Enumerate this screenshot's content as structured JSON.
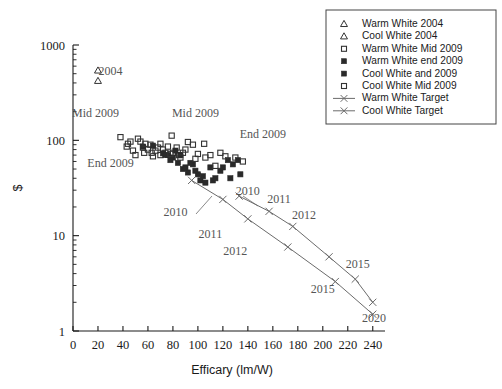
{
  "chart_data": {
    "type": "scatter",
    "title": "",
    "xlabel": "Efficary (lm/W)",
    "ylabel": "$",
    "xlim": [
      0,
      245
    ],
    "ylim": [
      1,
      1000
    ],
    "yscale": "log",
    "xticks": [
      0,
      20,
      40,
      60,
      80,
      100,
      120,
      140,
      160,
      180,
      200,
      220,
      240
    ],
    "xticklabels": [
      "0",
      "20",
      "40",
      "60",
      "80",
      "100",
      "120",
      "140",
      "160",
      "180",
      "200",
      "220",
      "240"
    ],
    "yticks": [
      1,
      10,
      100,
      1000
    ],
    "yticklabels": [
      "1",
      "10",
      "100",
      "1000"
    ],
    "grid": false,
    "legend_position": "top-right",
    "series": [
      {
        "name": "Warm White 2004",
        "marker": "open-triangle",
        "points": [
          [
            20,
            540
          ]
        ]
      },
      {
        "name": "Cool White 2004",
        "marker": "open-triangle",
        "points": [
          [
            20,
            420
          ]
        ]
      },
      {
        "name": "Warm White Mid 2009",
        "marker": "open-square",
        "points": [
          [
            38,
            108
          ],
          [
            43,
            86
          ],
          [
            46,
            97
          ],
          [
            48,
            78
          ],
          [
            52,
            104
          ],
          [
            54,
            97
          ],
          [
            56,
            84
          ],
          [
            57,
            74
          ],
          [
            60,
            80
          ],
          [
            62,
            90
          ],
          [
            63,
            74
          ],
          [
            66,
            78
          ],
          [
            68,
            84
          ],
          [
            70,
            70
          ],
          [
            72,
            80
          ],
          [
            74,
            74
          ],
          [
            76,
            86
          ],
          [
            79,
            112
          ],
          [
            80,
            74
          ],
          [
            83,
            84
          ],
          [
            85,
            70
          ],
          [
            88,
            74
          ],
          [
            92,
            96
          ],
          [
            96,
            90
          ],
          [
            100,
            72
          ],
          [
            105,
            92
          ],
          [
            110,
            70
          ],
          [
            118,
            74
          ],
          [
            130,
            66
          ]
        ]
      },
      {
        "name": "Warm White end 2009",
        "marker": "filled-square",
        "points": [
          [
            56,
            86
          ],
          [
            72,
            73
          ],
          [
            76,
            70
          ],
          [
            80,
            66
          ],
          [
            84,
            58
          ],
          [
            86,
            70
          ],
          [
            88,
            50
          ],
          [
            92,
            46
          ],
          [
            96,
            56
          ],
          [
            100,
            44
          ],
          [
            104,
            42
          ],
          [
            110,
            52
          ],
          [
            112,
            38
          ],
          [
            118,
            48
          ],
          [
            124,
            62
          ],
          [
            128,
            56
          ],
          [
            132,
            62
          ],
          [
            134,
            44
          ]
        ]
      },
      {
        "name": "Cool White and 2009",
        "marker": "filled-square",
        "points": [
          [
            64,
            88
          ],
          [
            74,
            70
          ],
          [
            78,
            62
          ],
          [
            82,
            78
          ],
          [
            90,
            52
          ],
          [
            94,
            58
          ],
          [
            98,
            48
          ],
          [
            102,
            38
          ],
          [
            106,
            36
          ],
          [
            114,
            40
          ],
          [
            120,
            52
          ],
          [
            126,
            40
          ]
        ]
      },
      {
        "name": "Cool White Mid 2009",
        "marker": "open-square",
        "points": [
          [
            44,
            92
          ],
          [
            50,
            70
          ],
          [
            58,
            92
          ],
          [
            64,
            68
          ],
          [
            70,
            92
          ],
          [
            78,
            72
          ],
          [
            86,
            66
          ],
          [
            90,
            80
          ],
          [
            98,
            64
          ],
          [
            106,
            66
          ],
          [
            114,
            54
          ],
          [
            122,
            68
          ],
          [
            136,
            60
          ]
        ]
      },
      {
        "name": "Warm White Target",
        "marker": "x-line",
        "points": [
          [
            95,
            38
          ],
          [
            120,
            24
          ],
          [
            140,
            15
          ],
          [
            172,
            7.6
          ],
          [
            210,
            3.3
          ],
          [
            240,
            1.5
          ]
        ],
        "point_labels": [
          "2010",
          "2011",
          "2012",
          "",
          "2015",
          "2020"
        ]
      },
      {
        "name": "Cool White Target",
        "marker": "x-line",
        "points": [
          [
            133,
            26
          ],
          [
            157,
            18
          ],
          [
            176,
            12.5
          ],
          [
            205,
            6.0
          ],
          [
            226,
            3.5
          ],
          [
            240,
            2.0
          ]
        ],
        "point_labels": [
          "2010",
          "2011",
          "2012",
          "",
          "2015",
          ""
        ]
      }
    ],
    "annotations": [
      {
        "text": "2004",
        "x": 30,
        "y": 490,
        "color": "#1a1a1a"
      },
      {
        "text": "Mid 2009",
        "x": 18,
        "y": 175,
        "color": "#555555"
      },
      {
        "text": "Mid 2009",
        "x": 98,
        "y": 175,
        "color": "#555555"
      },
      {
        "text": "End 2009",
        "x": 30,
        "y": 52,
        "color": "#555555"
      },
      {
        "text": "End 2009",
        "x": 152,
        "y": 105,
        "color": "#555555"
      },
      {
        "text": "2010",
        "x": 82,
        "y": 16,
        "color": "#555555"
      },
      {
        "text": "2010",
        "x": 140,
        "y": 27,
        "color": "#555555"
      },
      {
        "text": "2011",
        "x": 110,
        "y": 9.5,
        "color": "#555555"
      },
      {
        "text": "2011",
        "x": 165,
        "y": 22,
        "color": "#555555"
      },
      {
        "text": "2012",
        "x": 130,
        "y": 6.2,
        "color": "#555555"
      },
      {
        "text": "2012",
        "x": 185,
        "y": 15,
        "color": "#555555"
      },
      {
        "text": "2015",
        "x": 200,
        "y": 2.5,
        "color": "#555555"
      },
      {
        "text": "2015",
        "x": 228,
        "y": 4.6,
        "color": "#555555"
      },
      {
        "text": "2020",
        "x": 241,
        "y": 1.25,
        "color": "#1a1a1a"
      }
    ]
  },
  "legend": {
    "items": [
      {
        "label": "Warm White 2004",
        "marker": "open-triangle"
      },
      {
        "label": "Cool White 2004",
        "marker": "open-triangle"
      },
      {
        "label": "Warm White Mid 2009",
        "marker": "open-square"
      },
      {
        "label": "Warm White end 2009",
        "marker": "filled-square"
      },
      {
        "label": "Cool White and 2009",
        "marker": "filled-square"
      },
      {
        "label": "Cool White Mid 2009",
        "marker": "open-square"
      },
      {
        "label": "Warm White Target",
        "marker": "x-line"
      },
      {
        "label": "Cool White Target",
        "marker": "x-line"
      }
    ]
  },
  "colors": {
    "axis": "#1a1a1a",
    "marker_open": "#333333",
    "marker_filled": "#2a2a2a",
    "line": "#6b6b6b",
    "annotation": "#555555",
    "background": "#ffffff"
  }
}
